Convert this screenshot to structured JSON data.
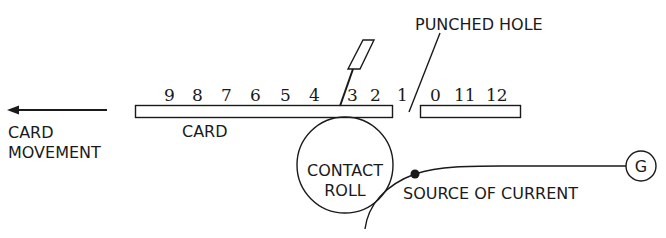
{
  "diagram": {
    "type": "punched-card-reader-schematic",
    "labels": {
      "punched_hole": "PUNCHED HOLE",
      "card": "CARD",
      "card_movement_line1": "CARD",
      "card_movement_line2": "MOVEMENT",
      "contact_roll_line1": "CONTACT",
      "contact_roll_line2": "ROLL",
      "source_of_current": "SOURCE OF CURRENT",
      "generator": "G"
    },
    "row_digits": [
      "9",
      "8",
      "7",
      "6",
      "5",
      "4",
      "3",
      "2",
      "1",
      "0",
      "11",
      "12"
    ],
    "colors": {
      "ink": "#1a1a1a",
      "background": "#ffffff"
    }
  }
}
